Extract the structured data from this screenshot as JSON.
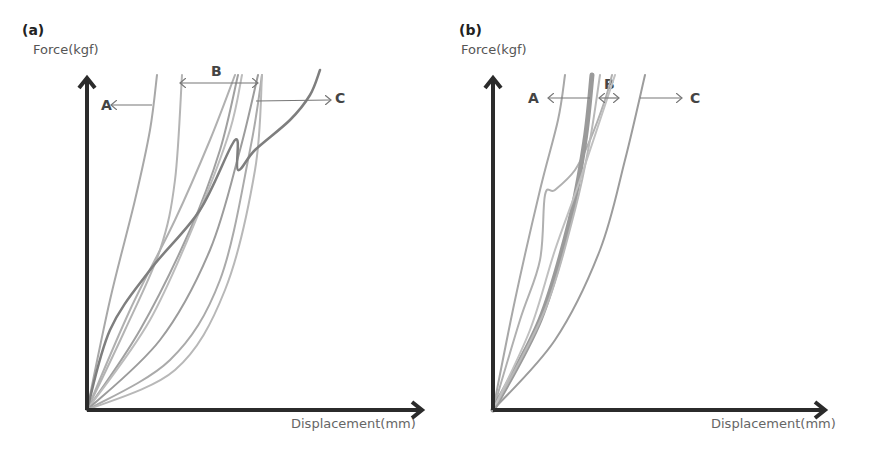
{
  "chart_data": [
    {
      "type": "line",
      "panel": "(a)",
      "title": "",
      "xlabel": "Displacement(mm)",
      "ylabel": "Force(kgf)",
      "grid": false,
      "ticks": "none",
      "annotations": [
        {
          "text": "A",
          "arrow": "left",
          "meaning": "curves left of group B"
        },
        {
          "text": "B",
          "arrow": "both",
          "meaning": "central group of curves"
        },
        {
          "text": "C",
          "arrow": "right",
          "meaning": "curves right of group B"
        }
      ],
      "axis_px": {
        "origin": [
          87,
          410
        ],
        "x_end": 425,
        "y_end": 75
      },
      "series": [
        {
          "name": "curve-1",
          "color": "#a8a8a8",
          "width": 2,
          "points": [
            [
              87,
              410
            ],
            [
              110,
              300
            ],
            [
              135,
              200
            ],
            [
              150,
              130
            ],
            [
              157,
              75
            ]
          ]
        },
        {
          "name": "curve-2",
          "color": "#b4b4b4",
          "width": 2,
          "points": [
            [
              87,
              410
            ],
            [
              125,
              330
            ],
            [
              160,
              250
            ],
            [
              175,
              180
            ],
            [
              182,
              75
            ]
          ]
        },
        {
          "name": "curve-3",
          "color": "#b0b0b0",
          "width": 2,
          "points": [
            [
              87,
              410
            ],
            [
              130,
              310
            ],
            [
              175,
              220
            ],
            [
              210,
              140
            ],
            [
              235,
              75
            ]
          ]
        },
        {
          "name": "curve-4",
          "color": "#a0a0a0",
          "width": 2,
          "points": [
            [
              87,
              410
            ],
            [
              140,
              330
            ],
            [
              190,
              230
            ],
            [
              220,
              150
            ],
            [
              238,
              75
            ]
          ]
        },
        {
          "name": "curve-5",
          "color": "#bcbcbc",
          "width": 2,
          "points": [
            [
              87,
              410
            ],
            [
              150,
              320
            ],
            [
              200,
              210
            ],
            [
              230,
              130
            ],
            [
              242,
              75
            ]
          ]
        },
        {
          "name": "curve-6",
          "color": "#9c9c9c",
          "width": 2,
          "points": [
            [
              87,
              410
            ],
            [
              160,
              340
            ],
            [
              210,
              250
            ],
            [
              240,
              150
            ],
            [
              258,
              75
            ]
          ]
        },
        {
          "name": "curve-7",
          "color": "#aaaaaa",
          "width": 2,
          "points": [
            [
              87,
              410
            ],
            [
              170,
              360
            ],
            [
              220,
              280
            ],
            [
              250,
              150
            ],
            [
              262,
              75
            ]
          ]
        },
        {
          "name": "curve-8",
          "color": "#b8b8b8",
          "width": 2,
          "points": [
            [
              87,
              410
            ],
            [
              175,
              370
            ],
            [
              225,
              290
            ],
            [
              255,
              170
            ],
            [
              262,
              75
            ]
          ]
        },
        {
          "name": "curve-9-dark",
          "color": "#7e7e7e",
          "width": 2.5,
          "points": [
            [
              87,
              410
            ],
            [
              110,
              330
            ],
            [
              150,
              270
            ],
            [
              200,
              210
            ],
            [
              235,
              140
            ],
            [
              238,
              170
            ],
            [
              255,
              150
            ],
            [
              290,
              120
            ],
            [
              310,
              95
            ],
            [
              320,
              70
            ]
          ]
        }
      ]
    },
    {
      "type": "line",
      "panel": "(b)",
      "title": "",
      "xlabel": "Displacement(mm)",
      "ylabel": "Force(kgf)",
      "grid": false,
      "ticks": "none",
      "annotations": [
        {
          "text": "A",
          "arrow": "left",
          "meaning": "curves left of group B"
        },
        {
          "text": "B",
          "arrow": "both",
          "meaning": "central group of curves"
        },
        {
          "text": "C",
          "arrow": "right",
          "meaning": "curves right of group B"
        }
      ],
      "axis_px": {
        "origin": [
          493,
          410
        ],
        "x_end": 828,
        "y_end": 75
      },
      "series": [
        {
          "name": "curve-1",
          "color": "#a8a8a8",
          "width": 2,
          "points": [
            [
              493,
              410
            ],
            [
              515,
              300
            ],
            [
              540,
              190
            ],
            [
              558,
              120
            ],
            [
              565,
              75
            ]
          ]
        },
        {
          "name": "curve-2",
          "color": "#b0b0b0",
          "width": 2,
          "points": [
            [
              493,
              410
            ],
            [
              520,
              320
            ],
            [
              540,
              260
            ],
            [
              545,
              195
            ],
            [
              555,
              190
            ],
            [
              575,
              170
            ],
            [
              590,
              140
            ],
            [
              605,
              100
            ],
            [
              612,
              75
            ]
          ]
        },
        {
          "name": "curve-3-thick",
          "color": "#9a9a9a",
          "width": 5,
          "points": [
            [
              493,
              410
            ],
            [
              540,
              320
            ],
            [
              570,
              220
            ],
            [
              585,
              140
            ],
            [
              592,
              75
            ]
          ]
        },
        {
          "name": "curve-4",
          "color": "#b8b8b8",
          "width": 2,
          "points": [
            [
              493,
              410
            ],
            [
              545,
              310
            ],
            [
              575,
              210
            ],
            [
              590,
              140
            ],
            [
              600,
              75
            ]
          ]
        },
        {
          "name": "curve-5",
          "color": "#c0c0c0",
          "width": 2,
          "points": [
            [
              493,
              410
            ],
            [
              530,
              330
            ],
            [
              555,
              250
            ],
            [
              580,
              180
            ],
            [
              615,
              75
            ]
          ]
        },
        {
          "name": "curve-6",
          "color": "#9c9c9c",
          "width": 2,
          "points": [
            [
              493,
              410
            ],
            [
              555,
              340
            ],
            [
              600,
              250
            ],
            [
              625,
              160
            ],
            [
              645,
              75
            ]
          ]
        }
      ]
    }
  ],
  "panels": {
    "a": {
      "label": "(a)",
      "ylabel": "Force(kgf)",
      "xlabel": "Displacement(mm)",
      "anno_a": "A",
      "anno_b": "B",
      "anno_c": "C"
    },
    "b": {
      "label": "(b)",
      "ylabel": "Force(kgf)",
      "xlabel": "Displacement(mm)",
      "anno_a": "A",
      "anno_b": "B",
      "anno_c": "C"
    }
  },
  "colors": {
    "axis": "#2b2b2b",
    "arrow": "#777777"
  }
}
